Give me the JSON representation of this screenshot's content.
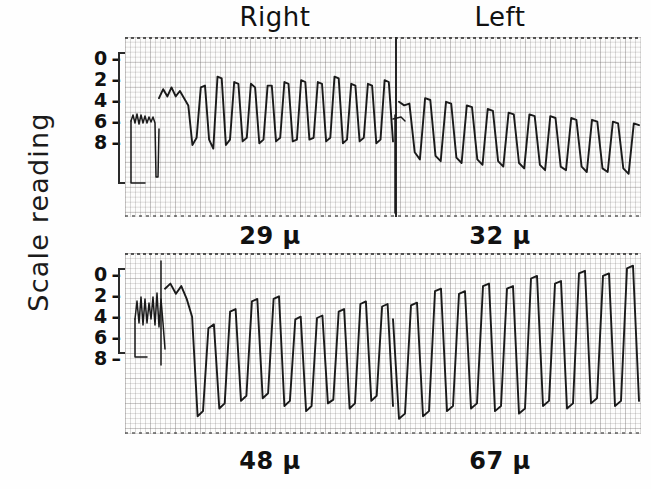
{
  "figure": {
    "y_axis_label": "Scale reading",
    "column_headers": [
      {
        "id": "right",
        "label": "Right"
      },
      {
        "id": "left",
        "label": "Left"
      }
    ],
    "y_ticks": [
      {
        "value": "0",
        "dash": "–"
      },
      {
        "value": "2",
        "dash": "–"
      },
      {
        "value": "4",
        "dash": "–"
      },
      {
        "value": "6",
        "dash": "–"
      },
      {
        "value": "8",
        "dash": "–"
      }
    ],
    "panels": [
      {
        "id": "panel-top",
        "captions": [
          {
            "id": "cap-29",
            "label": "29 μ"
          },
          {
            "id": "cap-32",
            "label": "32 μ"
          }
        ]
      },
      {
        "id": "panel-bottom",
        "captions": [
          {
            "id": "cap-48",
            "label": "48 μ"
          },
          {
            "id": "cap-67",
            "label": "67 μ"
          }
        ]
      }
    ],
    "colors": {
      "trace": "#1a1a1a",
      "grid_major": "#787373",
      "grid_minor": "#5f5a5a",
      "text": "#111111",
      "paper": "#fdfdfc"
    }
  },
  "chart_data": {
    "type": "line",
    "title": "",
    "subtitle": "",
    "ylabel": "Scale reading",
    "xlabel": "",
    "grid": true,
    "legend_position": "top",
    "ylim": [
      0,
      10
    ],
    "y_ticks": [
      0,
      2,
      4,
      6,
      8
    ],
    "y_tick_labels": [
      "0",
      "2",
      "4",
      "6",
      "8"
    ],
    "panel_headers": [
      "Right",
      "Left"
    ],
    "panels": [
      {
        "id": "panel-top",
        "segments": [
          {
            "name": "Right",
            "amplitude_label": "29 μ",
            "baseline": 6.8,
            "peak_mean": 5.6,
            "trough_mean": 8.6,
            "cycles": 16,
            "trend": "steady",
            "values": [
              6.6,
              6.1,
              6.5,
              6.0,
              6.5,
              6.2,
              6.6,
              7.0,
              9.2,
              8.8,
              6.0,
              5.9,
              8.9,
              9.4,
              5.4,
              5.5,
              9.2,
              8.9,
              5.7,
              5.8,
              9.0,
              8.8,
              5.8,
              6.0,
              9.1,
              8.9,
              5.9,
              5.9,
              9.0,
              8.8,
              5.7,
              5.8,
              9.0,
              8.9,
              5.6,
              5.7,
              8.9,
              8.8,
              5.7,
              5.8,
              9.0,
              8.8,
              5.4,
              5.5,
              9.1,
              8.9,
              5.8,
              5.9,
              9.0,
              8.8,
              5.8,
              5.9,
              9.1,
              8.9,
              5.6,
              5.7,
              9.0
            ]
          },
          {
            "name": "Left",
            "amplitude_label": "32 μ",
            "baseline": 7.0,
            "peak_mean": 6.6,
            "trough_mean": 9.8,
            "cycles": 15,
            "trend": "drifting-down",
            "values": [
              6.8,
              7.0,
              6.9,
              9.6,
              10.0,
              6.6,
              6.7,
              9.8,
              10.1,
              6.8,
              6.9,
              9.9,
              10.2,
              7.0,
              7.1,
              10.0,
              10.3,
              7.2,
              7.3,
              10.1,
              10.4,
              7.4,
              7.5,
              10.2,
              10.5,
              7.5,
              7.6,
              10.3,
              10.6,
              7.6,
              7.7,
              10.4,
              10.6,
              7.7,
              7.8,
              10.4,
              10.7,
              7.8,
              7.9,
              10.5,
              10.7,
              7.9,
              8.0,
              10.5,
              10.8,
              8.0,
              8.1
            ]
          }
        ]
      },
      {
        "id": "panel-bottom",
        "segments": [
          {
            "name": "Right",
            "amplitude_label": "48 μ",
            "baseline": 5.0,
            "peak_mean": 3.5,
            "trough_mean": 11.0,
            "cycles": 14,
            "trend": "growing",
            "values": [
              2.2,
              1.8,
              2.6,
              2.0,
              3.0,
              4.4,
              12.2,
              11.8,
              5.3,
              5.0,
              11.6,
              11.2,
              4.0,
              3.8,
              11.0,
              10.6,
              3.2,
              3.0,
              10.8,
              10.4,
              3.0,
              2.8,
              11.4,
              11.0,
              4.6,
              4.4,
              11.8,
              11.4,
              4.5,
              4.3,
              11.2,
              10.9,
              4.0,
              3.8,
              11.6,
              11.2,
              3.4,
              3.2,
              11.0,
              10.6,
              3.6,
              3.4,
              11.4
            ]
          },
          {
            "name": "Left",
            "amplitude_label": "67 μ",
            "baseline": 4.0,
            "peak_mean": 1.2,
            "trough_mean": 11.8,
            "cycles": 14,
            "trend": "growing",
            "values": [
              4.6,
              12.4,
              12.0,
              3.5,
              3.3,
              12.2,
              11.8,
              2.4,
              2.2,
              11.8,
              11.4,
              2.6,
              2.4,
              11.6,
              11.2,
              2.0,
              1.8,
              11.8,
              11.4,
              2.2,
              2.0,
              12.0,
              11.6,
              1.4,
              1.2,
              11.4,
              11.0,
              1.8,
              1.6,
              11.6,
              11.2,
              1.0,
              0.8,
              11.2,
              10.8,
              1.2,
              1.0,
              11.4,
              11.0,
              0.6,
              0.4,
              11.0
            ]
          }
        ]
      }
    ]
  }
}
